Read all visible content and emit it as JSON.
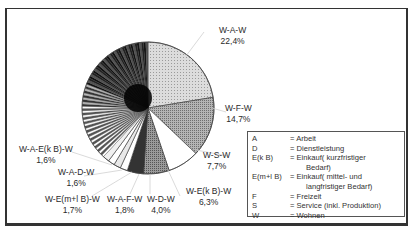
{
  "chart_data": {
    "type": "pie",
    "title": "",
    "slices": [
      {
        "label": "W-A-W",
        "value": 22.4,
        "value_label": "22,4%",
        "fill": "#d4d4d4"
      },
      {
        "label": "W-F-W",
        "value": 14.7,
        "value_label": "14,7%",
        "fill": "#a6a6a6"
      },
      {
        "label": "W-S-W",
        "value": 7.7,
        "value_label": "7,7%",
        "fill": "#ffffff"
      },
      {
        "label": "W-E(k B)-W",
        "value": 6.3,
        "value_label": "6,3%",
        "fill": "#8c8c8c"
      },
      {
        "label": "W-D-W",
        "value": 4.0,
        "value_label": "4,0%",
        "fill": "#333333"
      },
      {
        "label": "W-A-F-W",
        "value": 1.8,
        "value_label": "1,8%",
        "fill": "#ffffff"
      },
      {
        "label": "W-E(m+l B)-W",
        "value": 1.7,
        "value_label": "1,7%",
        "fill": "#e8e8e8"
      },
      {
        "label": "W-A-D-W",
        "value": 1.6,
        "value_label": "1,6%",
        "fill": "#ffffff"
      },
      {
        "label": "W-A-E(k B)-W",
        "value": 1.6,
        "value_label": "1,6%",
        "fill": "#f0f0f0"
      },
      {
        "label": "other (many small trip chains, unlabeled)",
        "value": 38.2,
        "value_label": "",
        "fill": "hatched"
      }
    ],
    "legend_position": "bottom-right",
    "grid": false
  },
  "labels": {
    "waw": {
      "name": "W-A-W",
      "pct": "22,4%"
    },
    "wfw": {
      "name": "W-F-W",
      "pct": "14,7%"
    },
    "wsw": {
      "name": "W-S-W",
      "pct": "7,7%"
    },
    "wekbw": {
      "name": "W-E(k B)-W",
      "pct": "6,3%"
    },
    "wdw": {
      "name": "W-D-W",
      "pct": "4,0%"
    },
    "wafw": {
      "name": "W-A-F-W",
      "pct": "1,8%"
    },
    "wemlbw": {
      "name": "W-E(m+l B)-W",
      "pct": "1,7%"
    },
    "wadw": {
      "name": "W-A-D-W",
      "pct": "1,6%"
    },
    "waekbw": {
      "name": "W-A-E(k B)-W",
      "pct": "1,6%"
    }
  },
  "legend": {
    "rows": [
      {
        "key": "A",
        "value": "= Arbeit"
      },
      {
        "key": "D",
        "value": "= Dienstleistung"
      },
      {
        "key": "E(k B)",
        "value": "= Einkauf( kurzfristiger"
      },
      {
        "key": "",
        "value": "Bedarf)"
      },
      {
        "key": "E(m+l B)",
        "value": "= Einkauf( mittel- und"
      },
      {
        "key": "",
        "value": "langfristiger Bedarf)"
      },
      {
        "key": "F",
        "value": "= Freizeit"
      },
      {
        "key": "S",
        "value": "= Service (inkl. Produktion)"
      },
      {
        "key": "W",
        "value": "= Wohnen"
      }
    ]
  }
}
